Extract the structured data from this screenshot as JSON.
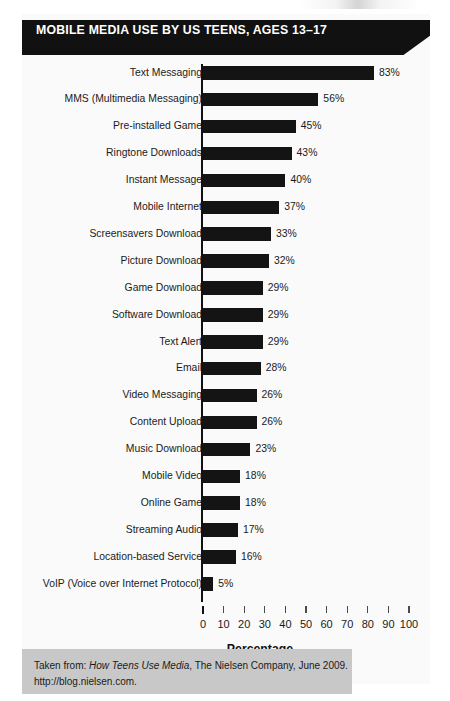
{
  "figure": {
    "title": "MOBILE MEDIA USE BY US TEENS, AGES 13–17",
    "title_bg_color": "#111111",
    "title_text_color": "#ffffff",
    "bar_color": "#141414",
    "footer_bg_color": "#c8c8c8"
  },
  "footer": {
    "line1_prefix": "Taken from: ",
    "line1_italic": "How Teens Use Media",
    "line1_suffix": ", The Nielsen Company, June 2009.",
    "line2": "http://blog.nielsen.com."
  },
  "chart_data": {
    "type": "bar",
    "orientation": "horizontal",
    "title": "MOBILE MEDIA USE BY US TEENS, AGES 13–17",
    "xlabel": "Percentage",
    "ylabel": "",
    "xlim": [
      0,
      100
    ],
    "xticks": [
      0,
      10,
      20,
      30,
      40,
      50,
      60,
      70,
      80,
      90,
      100
    ],
    "xtick_labels": [
      "0",
      "10",
      "20",
      "30",
      "40",
      "50",
      "60",
      "70",
      "80",
      "90",
      "100"
    ],
    "grid": false,
    "legend": false,
    "value_label_suffix": "%",
    "categories": [
      "Text Messaging",
      "MMS (Multimedia Messaging)",
      "Pre-installed Game",
      "Ringtone Downloads",
      "Instant Message",
      "Mobile Internet",
      "Screensavers Download",
      "Picture Download",
      "Game Download",
      "Software Download",
      "Text Alert",
      "Email",
      "Video Messaging",
      "Content Upload",
      "Music Download",
      "Mobile Video",
      "Online Game",
      "Streaming Audio",
      "Location-based Service",
      "VoIP (Voice over Internet Protocol)"
    ],
    "values": [
      83,
      56,
      45,
      43,
      40,
      37,
      33,
      32,
      29,
      29,
      29,
      28,
      26,
      26,
      23,
      18,
      18,
      17,
      16,
      5
    ],
    "value_labels": [
      "83%",
      "56%",
      "45%",
      "43%",
      "40%",
      "37%",
      "33%",
      "32%",
      "29%",
      "29%",
      "29%",
      "28%",
      "26%",
      "26%",
      "23%",
      "18%",
      "18%",
      "17%",
      "16%",
      "5%"
    ]
  }
}
